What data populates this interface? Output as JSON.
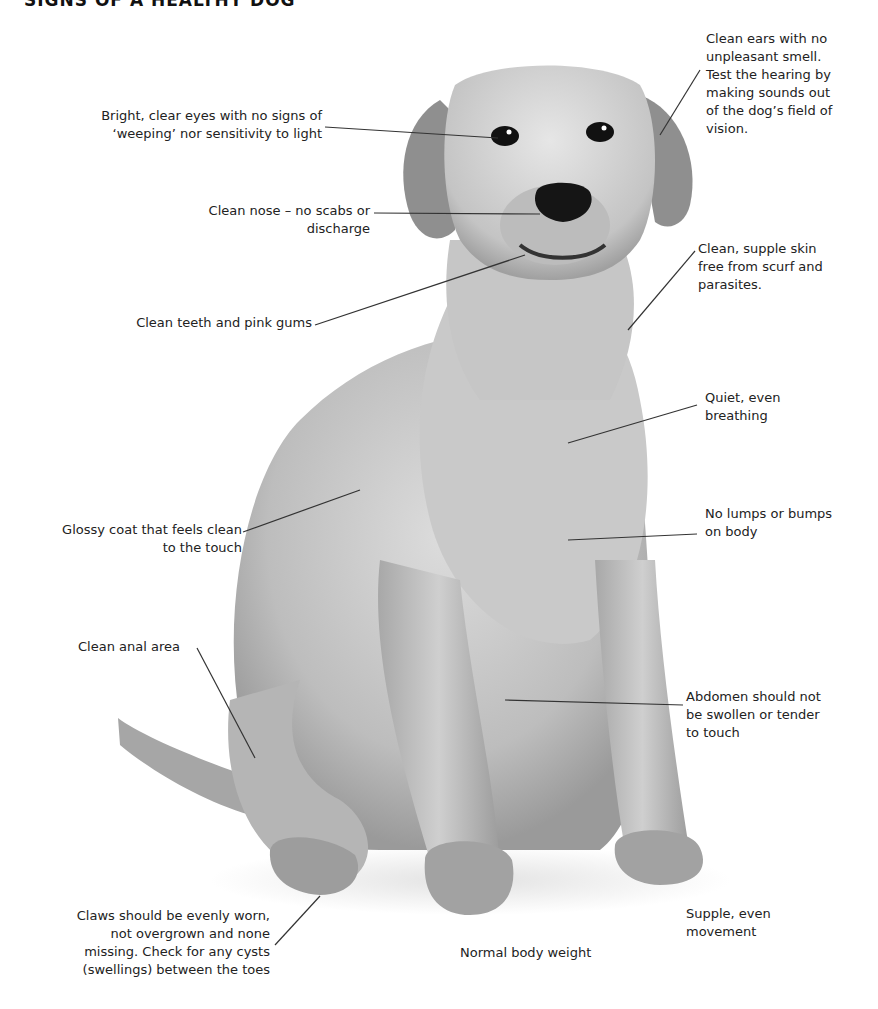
{
  "title": "SIGNS OF A HEALTHY DOG",
  "colors": {
    "background": "#ffffff",
    "text": "#222222",
    "leader_line": "#333333",
    "dog_fur_light": "#d8d8d8",
    "dog_fur_mid": "#b0b0b0",
    "dog_fur_dark": "#7a7a7a",
    "dog_nose": "#111111"
  },
  "labels": {
    "eyes": "Bright, clear eyes with no signs of\n‘weeping’ nor sensitivity to light",
    "ears": "Clean ears with no\nunpleasant smell.\nTest the hearing by\nmaking sounds out\nof the dog’s field of\nvision.",
    "nose": "Clean nose – no scabs or\ndischarge",
    "skin": "Clean, supple skin\nfree from scurf and\nparasites.",
    "teeth": "Clean teeth and pink gums",
    "breathing": "Quiet, even\nbreathing",
    "coat": "Glossy coat that feels clean\nto the touch",
    "lumps": "No lumps or bumps\non body",
    "anal": "Clean anal area",
    "abdomen": "Abdomen should not\nbe swollen or tender\nto touch",
    "claws": "Claws should be evenly worn,\nnot overgrown and none\nmissing. Check for any cysts\n(swellings) between the toes",
    "movement": "Supple, even\nmovement",
    "weight": "Normal body weight"
  }
}
